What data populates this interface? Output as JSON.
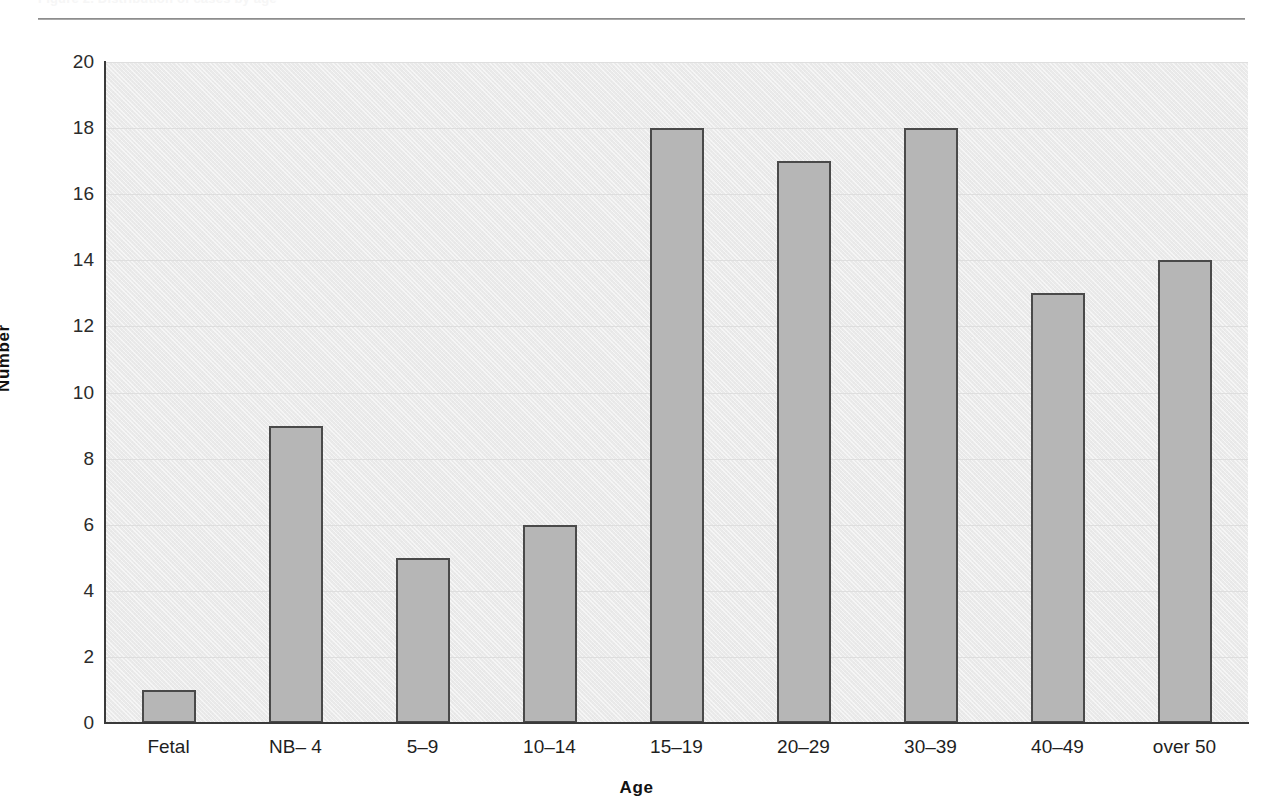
{
  "caption": {
    "text": "Figure 2. Distribution of cases by age"
  },
  "chart_data": {
    "type": "bar",
    "title": "",
    "subtitle": "",
    "xlabel": "Age",
    "ylabel": "Number",
    "categories": [
      "Fetal",
      "NB– 4",
      "5–9",
      "10–14",
      "15–19",
      "20–29",
      "30–39",
      "40–49",
      "over 50"
    ],
    "values": [
      1,
      9,
      5,
      6,
      18,
      17,
      18,
      13,
      14
    ],
    "ylim": [
      0,
      20
    ],
    "ytick_step": 2,
    "ytick_labels": [
      "0",
      "2",
      "4",
      "6",
      "8",
      "10",
      "12",
      "14",
      "16",
      "18",
      "20"
    ],
    "grid": true,
    "grid_axis": "y",
    "legend": false,
    "legend_position": "none",
    "bar_fill_color": "#b6b6b6",
    "bar_border_color": "#4a4a4a",
    "plot_background_color": "#eaeaea",
    "axis_color": "#3a3a3a",
    "gridline_color": "#dedede"
  }
}
